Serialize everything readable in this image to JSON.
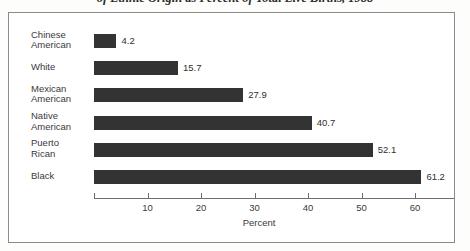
{
  "title": "of Ethnic Origin as Percent of Total Live Births, 1988",
  "chart_data": {
    "type": "bar",
    "orientation": "horizontal",
    "title": "of Ethnic Origin as Percent of Total Live Births, 1988",
    "xlabel": "Percent",
    "ylabel": "",
    "categories": [
      "Chinese American",
      "White",
      "Mexican American",
      "Native American",
      "Puerto Rican",
      "Black"
    ],
    "category_lines": [
      [
        "Chinese",
        "American"
      ],
      [
        "White",
        ""
      ],
      [
        "Mexican",
        "American"
      ],
      [
        "Native",
        "American"
      ],
      [
        "Puerto",
        "Rican"
      ],
      [
        "Black",
        ""
      ]
    ],
    "values": [
      4.2,
      15.7,
      27.9,
      40.7,
      52.1,
      61.2
    ],
    "value_labels": [
      "4.2",
      "15.7",
      "27.9",
      "40.7",
      "52.1",
      "61.2"
    ],
    "xticks": [
      10,
      20,
      30,
      40,
      50,
      60
    ],
    "xtick_labels": [
      "10",
      "20",
      "30",
      "40",
      "50",
      "60"
    ],
    "xlim": [
      0,
      65
    ],
    "grid": false,
    "legend": false,
    "bar_color": "#333333",
    "frame_color": "#8b8b8b",
    "axis_color": "#6f6f6f"
  }
}
